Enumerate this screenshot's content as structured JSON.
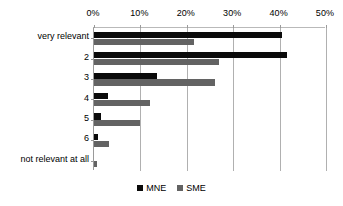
{
  "chart_data": {
    "type": "bar",
    "orientation": "horizontal",
    "title": "",
    "subtitle": "",
    "xlabel": "",
    "ylabel": "",
    "xlim": [
      0,
      50
    ],
    "xunit": "%",
    "grid": true,
    "legend_position": "bottom-center",
    "categories": [
      "very relevant",
      "2",
      "3",
      "4",
      "5",
      "6",
      "not relevant at all"
    ],
    "x_tick_labels": [
      "0%",
      "10%",
      "20%",
      "30%",
      "40%",
      "50%"
    ],
    "x_tick_values": [
      0,
      10,
      20,
      30,
      40,
      50
    ],
    "series": [
      {
        "name": "MNE",
        "color": "#0a0a0a",
        "values": [
          40.5,
          41.5,
          13.5,
          3.0,
          1.5,
          0.8,
          0.0
        ]
      },
      {
        "name": "SME",
        "color": "#636363",
        "values": [
          21.5,
          27.0,
          26.0,
          12.0,
          10.0,
          3.3,
          0.6
        ]
      }
    ]
  },
  "legend": {
    "entries": [
      {
        "label": "MNE",
        "color": "#0a0a0a"
      },
      {
        "label": "SME",
        "color": "#636363"
      }
    ]
  }
}
